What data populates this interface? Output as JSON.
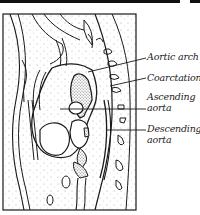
{
  "figure": {
    "type": "anatomical line drawing"
  },
  "labels": [
    {
      "id": "aortic-arch",
      "text": "Aortic arch"
    },
    {
      "id": "coarctation",
      "text": "Coarctation"
    },
    {
      "id": "ascending-aorta",
      "line1": "Ascending",
      "line2": "aorta"
    },
    {
      "id": "descending-aorta",
      "line1": "Descending",
      "line2": "aorta"
    }
  ],
  "colors": {
    "line": "#1a1a1a",
    "background": "#ffffff",
    "stipple": "#9a9a9a"
  }
}
